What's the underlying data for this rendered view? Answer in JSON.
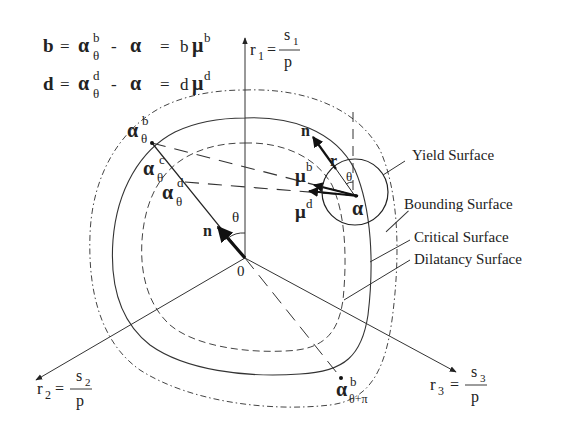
{
  "equations": {
    "line1": {
      "lhs": "b",
      "eq": "=",
      "alpha": "α",
      "sup": "b",
      "sub": "θ",
      "minus": "-",
      "alpha2": "α",
      "eq2": "=",
      "coef": "b",
      "mu": "μ",
      "musup": "b"
    },
    "line2": {
      "lhs": "d",
      "eq": "=",
      "alpha": "α",
      "sup": "d",
      "sub": "θ",
      "minus": "-",
      "alpha2": "α",
      "eq2": "=",
      "coef": "d",
      "mu": "μ",
      "musup": "d"
    }
  },
  "axes": {
    "r1": {
      "label": "r",
      "sub": "1",
      "eq": "=",
      "num": "s",
      "numsub": "1",
      "den": "p"
    },
    "r2": {
      "label": "r",
      "sub": "2",
      "eq": "=",
      "num": "s",
      "numsub": "2",
      "den": "p"
    },
    "r3": {
      "label": "r",
      "sub": "3",
      "eq": "=",
      "num": "s",
      "numsub": "3",
      "den": "p"
    }
  },
  "points": {
    "origin": "0",
    "alpha_b": {
      "base": "α",
      "sup": "b",
      "sub": "θ"
    },
    "alpha_c": {
      "base": "α",
      "sup": "c",
      "sub": "θ"
    },
    "alpha_d": {
      "base": "α",
      "sup": "d",
      "sub": "θ"
    },
    "alpha_b_opposite": {
      "base": "α",
      "sup": "b",
      "sub": "θ+π"
    },
    "alpha": "α"
  },
  "vectors": {
    "n_origin": "n",
    "n_yield": "n",
    "r": "r",
    "mu_b": {
      "base": "μ",
      "sup": "b"
    },
    "mu_d": {
      "base": "μ",
      "sup": "d"
    },
    "theta_origin": "θ",
    "theta_yield": "θ"
  },
  "surfaces": [
    {
      "name": "Yield Surface",
      "style": "solid circle"
    },
    {
      "name": "Bounding Surface",
      "style": "dash-dot"
    },
    {
      "name": "Critical Surface",
      "style": "solid"
    },
    {
      "name": "Dilatancy Surface",
      "style": "dashed"
    }
  ]
}
